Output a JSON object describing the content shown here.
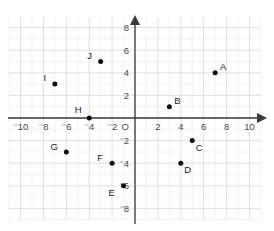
{
  "chart_data": {
    "type": "scatter",
    "title": "",
    "xlabel": "",
    "ylabel": "",
    "xlim": [
      -11,
      11
    ],
    "ylim": [
      -9,
      9
    ],
    "grid": true,
    "grid_step": 1,
    "legend": "none",
    "origin_label": "O",
    "x_ticks": [
      {
        "value": -10,
        "label": "⁻10"
      },
      {
        "value": -8,
        "label": "⁻8"
      },
      {
        "value": -6,
        "label": "⁻6"
      },
      {
        "value": -4,
        "label": "⁻4"
      },
      {
        "value": -2,
        "label": "⁻2"
      },
      {
        "value": 2,
        "label": "2"
      },
      {
        "value": 4,
        "label": "4"
      },
      {
        "value": 6,
        "label": "6"
      },
      {
        "value": 8,
        "label": "8"
      },
      {
        "value": 10,
        "label": "10"
      }
    ],
    "y_ticks": [
      {
        "value": 8,
        "label": "8"
      },
      {
        "value": 6,
        "label": "6"
      },
      {
        "value": 4,
        "label": "4"
      },
      {
        "value": 2,
        "label": "2"
      },
      {
        "value": -2,
        "label": "⁻2"
      },
      {
        "value": -4,
        "label": "⁻4"
      },
      {
        "value": -6,
        "label": "⁻6"
      },
      {
        "value": -8,
        "label": "⁻8"
      }
    ],
    "points": [
      {
        "label": "A",
        "x": 7,
        "y": 4,
        "label_dx": 8,
        "label_dy": -3
      },
      {
        "label": "B",
        "x": 3,
        "y": 1,
        "label_dx": 8,
        "label_dy": -3
      },
      {
        "label": "C",
        "x": 5,
        "y": -2,
        "label_dx": 7,
        "label_dy": 10
      },
      {
        "label": "D",
        "x": 4,
        "y": -4,
        "label_dx": 7,
        "label_dy": 10
      },
      {
        "label": "E",
        "x": -1,
        "y": -6,
        "label_dx": -12,
        "label_dy": 10
      },
      {
        "label": "F",
        "x": -2,
        "y": -4,
        "label_dx": -12,
        "label_dy": -2
      },
      {
        "label": "G",
        "x": -6,
        "y": -3,
        "label_dx": -12,
        "label_dy": -2
      },
      {
        "label": "H",
        "x": -4,
        "y": 0,
        "label_dx": -11,
        "label_dy": -5
      },
      {
        "label": "I",
        "x": -7,
        "y": 3,
        "label_dx": -10,
        "label_dy": -3
      },
      {
        "label": "J",
        "x": -3,
        "y": 5,
        "label_dx": -11,
        "label_dy": -3
      }
    ]
  },
  "colors": {
    "point": "#111111",
    "axis": "#3a3a3a",
    "grid_minor": "#e9e9ee",
    "grid_major": "#dcdce4",
    "tick_text": "#4a4a4a",
    "background": "#ffffff"
  }
}
